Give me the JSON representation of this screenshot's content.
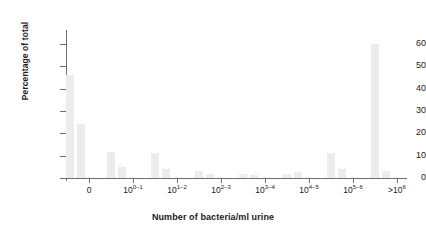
{
  "chart_data": {
    "type": "bar",
    "title": "",
    "xlabel": "Number of bacteria/ml urine",
    "ylabel": "Percentage of total",
    "ylim": [
      0,
      65
    ],
    "yticks": [
      0,
      10,
      20,
      30,
      40,
      50,
      60
    ],
    "ytick_labels": [
      "0",
      "10",
      "20",
      "30",
      "40",
      "50",
      "60"
    ],
    "grid": false,
    "legend": null,
    "bar_color": "#ececec",
    "axis_color": "#6e6e6e",
    "categories": [
      "0",
      "10^0-1",
      "10^1-2",
      "10^2-3",
      "10^3-4",
      "10^4-5",
      "10^5-6",
      ">10^6"
    ],
    "xtick_labels": [
      {
        "base": "0",
        "exp": ""
      },
      {
        "base": "10",
        "exp": "0–1"
      },
      {
        "base": "10",
        "exp": "1–2"
      },
      {
        "base": "10",
        "exp": "2–3"
      },
      {
        "base": "10",
        "exp": "3–4"
      },
      {
        "base": "10",
        "exp": "4–5"
      },
      {
        "base": "10",
        "exp": "5–6"
      },
      {
        "base": ">10",
        "exp": "6"
      }
    ],
    "bars": [
      {
        "label": "0 (a)",
        "x_px": 0,
        "width_px": 8,
        "value": 46
      },
      {
        "label": "0 (b)",
        "x_px": 11,
        "width_px": 8,
        "value": 24
      },
      {
        "label": "10^0-1 (a)",
        "x_px": 41,
        "width_px": 8,
        "value": 11.5
      },
      {
        "label": "10^0-1 (b)",
        "x_px": 52,
        "width_px": 8,
        "value": 5
      },
      {
        "label": "10^1-2 (a)",
        "x_px": 85,
        "width_px": 8,
        "value": 11
      },
      {
        "label": "10^1-2 (b)",
        "x_px": 96,
        "width_px": 8,
        "value": 4
      },
      {
        "label": "10^2-3 (a)",
        "x_px": 129,
        "width_px": 8,
        "value": 3
      },
      {
        "label": "10^2-3 (b)",
        "x_px": 140,
        "width_px": 8,
        "value": 2
      },
      {
        "label": "10^3-4 (a)",
        "x_px": 173,
        "width_px": 8,
        "value": 2
      },
      {
        "label": "10^3-4 (b)",
        "x_px": 184,
        "width_px": 8,
        "value": 1.5
      },
      {
        "label": "10^4-5 (a)",
        "x_px": 217,
        "width_px": 8,
        "value": 2
      },
      {
        "label": "10^4-5 (b)",
        "x_px": 228,
        "width_px": 8,
        "value": 2.5
      },
      {
        "label": "10^5-6 (a)",
        "x_px": 261,
        "width_px": 8,
        "value": 11
      },
      {
        "label": "10^5-6 (b)",
        "x_px": 272,
        "width_px": 8,
        "value": 4
      },
      {
        "label": ">10^6 (a)",
        "x_px": 305,
        "width_px": 8,
        "value": 60
      },
      {
        "label": ">10^6 (b)",
        "x_px": 316,
        "width_px": 8,
        "value": 3
      }
    ],
    "xtick_positions_px": [
      23,
      67,
      111,
      155,
      199,
      243,
      287,
      331
    ]
  }
}
